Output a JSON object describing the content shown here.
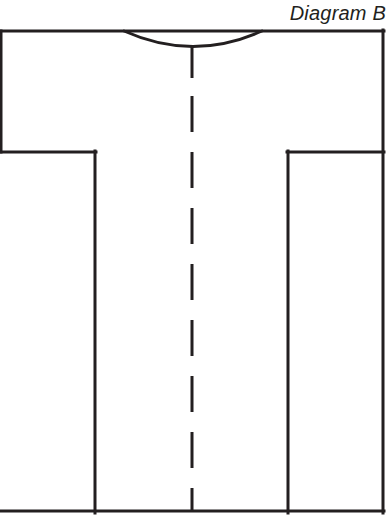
{
  "page": {
    "width": 392,
    "height": 525,
    "background_color": "#ffffff",
    "ink_color": "#231f20"
  },
  "title": {
    "text": "Diagram B",
    "style": "italic",
    "position": "top-right"
  },
  "diagram": {
    "name": "garment-flat-sketch",
    "stroke_color": "#231f20",
    "stroke_width": 3,
    "parts": {
      "shoulder_line": {
        "name": "shoulder-line",
        "x1": 0,
        "y1": 31,
        "x2": 384,
        "y2": 31
      },
      "neckline": {
        "name": "neckline-arc",
        "left_x": 124,
        "right_x": 262,
        "top_y": 31,
        "bottom_y": 47
      },
      "left_sleeve_hem": {
        "name": "left-sleeve-hem",
        "x1": 0,
        "y1": 152,
        "x2": 95,
        "y2": 152
      },
      "right_sleeve_hem": {
        "name": "right-sleeve-hem",
        "x1": 288,
        "y1": 152,
        "x2": 384,
        "y2": 152
      },
      "left_side_seam": {
        "name": "left-side-seam",
        "x1": 95,
        "y1": 152,
        "x2": 95,
        "y2": 512
      },
      "right_side_seam": {
        "name": "right-side-seam",
        "x1": 288,
        "y1": 152,
        "x2": 288,
        "y2": 512
      },
      "left_outer_edge": {
        "name": "left-outer-edge",
        "x1": 0,
        "y1": 31,
        "x2": 0,
        "y2": 152
      },
      "right_outer_edge": {
        "name": "right-outer-edge",
        "x1": 384,
        "y1": 31,
        "x2": 384,
        "y2": 512
      },
      "bottom_hem": {
        "name": "bottom-hem",
        "x1": 0,
        "y1": 512,
        "x2": 384,
        "y2": 512
      },
      "center_front_line": {
        "name": "center-front-dashed-line",
        "x": 192,
        "solid_from_y": 45,
        "solid_to_y": 78,
        "dashed_from_y": 95,
        "dashed_to_y": 512,
        "dash_length": 36,
        "gap_length": 20
      }
    }
  }
}
